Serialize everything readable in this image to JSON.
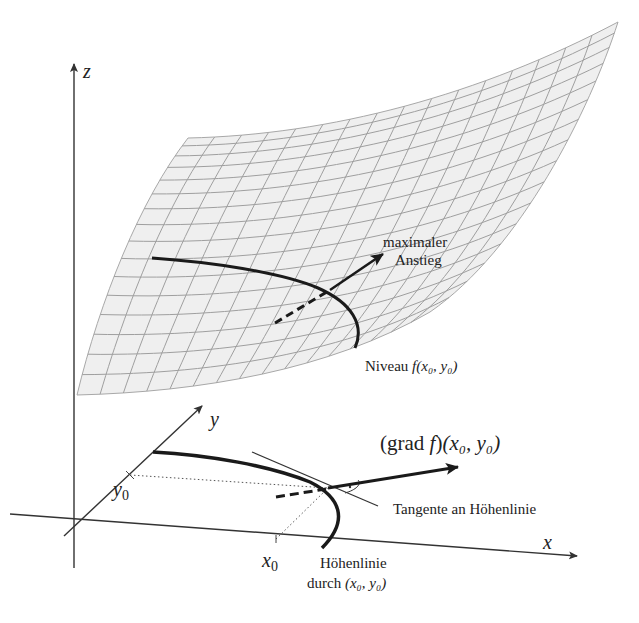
{
  "figure": {
    "type": "gradient-level-curve-diagram",
    "colors": {
      "background": "#ffffff",
      "surface_fill": "#eeeeee",
      "grid": "#9a9a9a",
      "curve": "#1a1a1a",
      "axis": "#333333"
    }
  },
  "axes": {
    "z": {
      "label": "z"
    },
    "y": {
      "label": "y"
    },
    "x": {
      "label": "x"
    }
  },
  "ticks": {
    "x0": {
      "base": "x",
      "sub": "0"
    },
    "y0": {
      "base": "y",
      "sub": "0"
    }
  },
  "surface_labels": {
    "max_ascent_line1": "maximaler",
    "max_ascent_line2": "Anstieg",
    "level_prefix": "Niveau ",
    "level_func": "f",
    "level_args": "(x₀, y₀)"
  },
  "plane_labels": {
    "gradient_prefix": "(grad ",
    "gradient_func": "f",
    "gradient_suffix": ")",
    "gradient_args": "(x₀, y₀)",
    "tangent": "Tangente an Höhenlinie",
    "contour_line1": "Höhenlinie",
    "contour_line2_prefix": "durch ",
    "contour_line2_args": "(x₀, y₀)"
  }
}
